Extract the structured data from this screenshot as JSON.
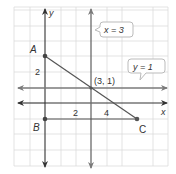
{
  "diagram": {
    "type": "coordinate-plane",
    "grid": {
      "x_min": -2,
      "x_max": 8,
      "y_min": -4,
      "y_max": 6,
      "origin_px": [
        45,
        103
      ],
      "unit_px": 15.4
    },
    "axes": {
      "x_label": "x",
      "y_label": "y",
      "x_ticks": [
        "2",
        "4"
      ],
      "y_ticks": [
        "2"
      ]
    },
    "points": [
      {
        "name": "A",
        "label": "A",
        "x": 0,
        "y": 3
      },
      {
        "name": "B",
        "label": "B",
        "x": 0,
        "y": -1
      },
      {
        "name": "C",
        "label": "C",
        "x": 6,
        "y": -1
      }
    ],
    "intersection": {
      "label": "(3, 1)",
      "x": 3,
      "y": 1
    },
    "lines": [
      {
        "name": "vertical-line-x3",
        "equation": "x = 3"
      },
      {
        "name": "horizontal-line-y1",
        "equation": "y = 1"
      }
    ],
    "segments": [
      "AB",
      "BC",
      "AC"
    ],
    "callouts": {
      "x3": "x = 3",
      "y1": "y = 1"
    },
    "colors": {
      "grid": "#d9d9d9",
      "axis": "#333333",
      "line": "#7a7a7a",
      "segment": "#555555",
      "callout_border": "#bbbbbb"
    }
  }
}
